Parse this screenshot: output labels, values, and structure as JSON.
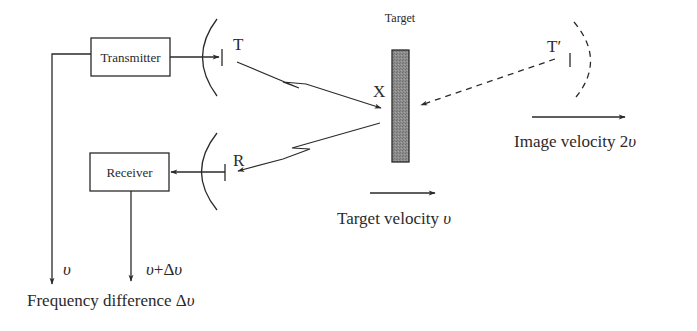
{
  "diagram": {
    "blocks": {
      "transmitter": {
        "label": "Transmitter"
      },
      "receiver": {
        "label": "Receiver"
      }
    },
    "antennas": {
      "transmit": {
        "label": "T"
      },
      "receive": {
        "label": "R"
      },
      "image": {
        "label": "T′"
      }
    },
    "target": {
      "label": "Target",
      "reflection_point": "X",
      "fill_color": "#8c8c8c"
    },
    "velocities": {
      "target": {
        "text": "Target velocity ",
        "symbol": "υ"
      },
      "image": {
        "text": "Image velocity 2",
        "symbol": "υ"
      }
    },
    "outputs": {
      "reference": {
        "symbol": "υ"
      },
      "received": {
        "symbol": "υ",
        "rest": "+Δ",
        "symbol2": "υ"
      },
      "difference": {
        "text": "Frequency difference Δ",
        "symbol": "υ"
      }
    },
    "colors": {
      "line": "#2a2a2a",
      "background": "#ffffff"
    }
  }
}
